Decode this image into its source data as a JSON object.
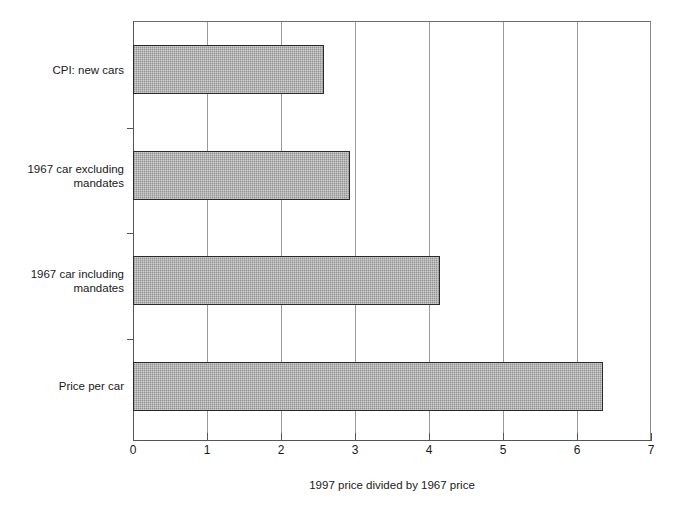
{
  "chart_data": {
    "type": "bar",
    "orientation": "horizontal",
    "title": "",
    "xlabel": "1997 price divided by 1967 price",
    "ylabel": "",
    "categories": [
      "CPI: new cars",
      "1967 car excluding\nmandates",
      "1967 car including\nmandates",
      "Price per car"
    ],
    "values": [
      2.58,
      2.93,
      4.15,
      6.35
    ],
    "xlim": [
      0,
      7
    ],
    "xticks": [
      0,
      1,
      2,
      3,
      4,
      5,
      6,
      7
    ],
    "xtick_labels": [
      "0",
      "1",
      "2",
      "3",
      "4",
      "5",
      "6",
      "7"
    ],
    "grid": "vertical",
    "legend": "none",
    "bar_fill_color": "#a9a9a9",
    "bar_border_color": "#2b2b2b",
    "gridline_color": "#9a9a9a",
    "axis_color": "#555555",
    "background_color": "#ffffff"
  }
}
